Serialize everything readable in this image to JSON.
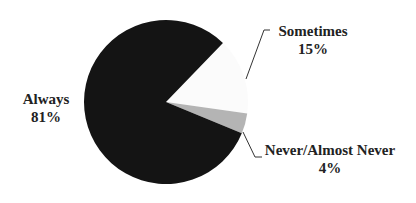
{
  "chart_data": {
    "type": "pie",
    "title": "",
    "categories": [
      "Sometimes",
      "Never/Almost Never",
      "Always"
    ],
    "values": [
      15,
      4,
      81
    ],
    "labels": [
      {
        "name": "Sometimes",
        "pct": "15%"
      },
      {
        "name": "Never/Almost Never",
        "pct": "4%"
      },
      {
        "name": "Always",
        "pct": "81%"
      }
    ],
    "colors": {
      "Always": "#141414",
      "Sometimes": "#fbfbfb",
      "Never/Almost Never": "#b4b4b4"
    },
    "legend": "none (data labels with leader lines)"
  }
}
